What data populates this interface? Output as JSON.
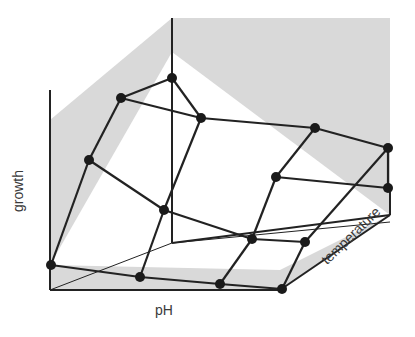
{
  "diagram": {
    "title": "",
    "colors": {
      "background": "#ffffff",
      "wall_fill": "#d9d9d9",
      "line": "#222222",
      "node": "#1a1a1a"
    },
    "axes": {
      "vertical": "growth",
      "horizontal": "pH",
      "depth": "temperature"
    },
    "walls": {
      "back_left": [
        [
          50,
          120
        ],
        [
          172,
          18
        ],
        [
          172,
          52
        ],
        [
          50,
          265
        ]
      ],
      "back_right": [
        [
          172,
          18
        ],
        [
          390,
          18
        ],
        [
          390,
          215
        ],
        [
          172,
          52
        ]
      ],
      "floor": [
        [
          50,
          290
        ],
        [
          280,
          290
        ],
        [
          390,
          215
        ],
        [
          280,
          270
        ],
        [
          50,
          265
        ]
      ]
    },
    "frame_lines": [
      [
        [
          50,
          90
        ],
        [
          50,
          290
        ]
      ],
      [
        [
          50,
          290
        ],
        [
          280,
          290
        ]
      ],
      [
        [
          280,
          290
        ],
        [
          390,
          215
        ]
      ],
      [
        [
          390,
          185
        ],
        [
          390,
          215
        ]
      ],
      [
        [
          172,
          18
        ],
        [
          172,
          243
        ]
      ],
      [
        [
          172,
          243
        ],
        [
          390,
          215
        ]
      ]
    ],
    "thin_lines": [
      [
        [
          50,
          290
        ],
        [
          172,
          243
        ]
      ],
      [
        [
          172,
          52
        ],
        [
          172,
          243
        ]
      ],
      [
        [
          172,
          243
        ],
        [
          390,
          222
        ]
      ]
    ],
    "nodes": [
      {
        "id": "a1",
        "x": 172,
        "y": 78
      },
      {
        "id": "a2",
        "x": 121,
        "y": 98
      },
      {
        "id": "a3",
        "x": 89,
        "y": 160
      },
      {
        "id": "a4",
        "x": 51,
        "y": 265
      },
      {
        "id": "b1",
        "x": 201,
        "y": 118
      },
      {
        "id": "b2",
        "x": 315,
        "y": 128
      },
      {
        "id": "b3",
        "x": 388,
        "y": 148
      },
      {
        "id": "c1",
        "x": 276,
        "y": 177
      },
      {
        "id": "c2",
        "x": 388,
        "y": 188
      },
      {
        "id": "d1",
        "x": 164,
        "y": 210
      },
      {
        "id": "d2",
        "x": 252,
        "y": 239
      },
      {
        "id": "d3",
        "x": 305,
        "y": 242
      },
      {
        "id": "e1",
        "x": 140,
        "y": 277
      },
      {
        "id": "e2",
        "x": 220,
        "y": 284
      },
      {
        "id": "e3",
        "x": 282,
        "y": 289
      }
    ],
    "edges": [
      [
        "a1",
        "a2"
      ],
      [
        "a2",
        "a3"
      ],
      [
        "a3",
        "a4"
      ],
      [
        "a1",
        "b1"
      ],
      [
        "a2",
        "b1"
      ],
      [
        "b1",
        "b2"
      ],
      [
        "b2",
        "b3"
      ],
      [
        "b1",
        "d1"
      ],
      [
        "a3",
        "d1"
      ],
      [
        "b2",
        "c1"
      ],
      [
        "b3",
        "c2"
      ],
      [
        "b3",
        "d3"
      ],
      [
        "c1",
        "c2"
      ],
      [
        "c1",
        "d2"
      ],
      [
        "d1",
        "d2"
      ],
      [
        "d2",
        "d3"
      ],
      [
        "d1",
        "e1"
      ],
      [
        "a4",
        "e1"
      ],
      [
        "d2",
        "e2"
      ],
      [
        "e1",
        "e2"
      ],
      [
        "e2",
        "e3"
      ],
      [
        "d3",
        "e3"
      ]
    ]
  }
}
